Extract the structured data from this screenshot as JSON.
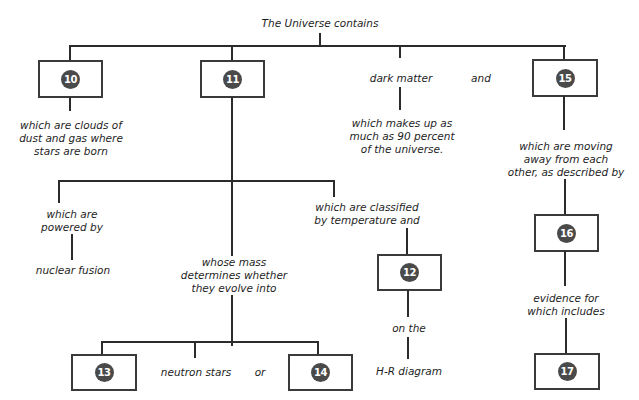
{
  "diagram": {
    "title": "The Universe contains",
    "colors": {
      "line": "#2b2b2b",
      "box_border": "#3a3a3a",
      "badge_fill": "#4a4a4a",
      "badge_text": "#ffffff",
      "text": "#1e1e1e",
      "background": "#ffffff"
    },
    "boxes": {
      "b10": "10",
      "b11": "11",
      "b12": "12",
      "b13": "13",
      "b14": "14",
      "b15": "15",
      "b16": "16",
      "b17": "17"
    },
    "labels": {
      "dark_matter": "dark matter",
      "and_top": "and",
      "clouds": "which are clouds of\ndust and gas where\nstars are born",
      "dark_matter_desc": "which makes up as\nmuch as 90 percent\nof the universe.",
      "moving_away": "which are moving\naway from each\nother, as described by",
      "powered_by": "which are\npowered by",
      "nuclear_fusion": "nuclear fusion",
      "classified": "which are classified\nby temperature and",
      "whose_mass": "whose mass\ndetermines whether\nthey evolve into",
      "on_the": "on the",
      "hr_diagram": "H-R diagram",
      "evidence": "evidence for\nwhich includes",
      "neutron_stars": "neutron stars",
      "or": "or"
    }
  }
}
